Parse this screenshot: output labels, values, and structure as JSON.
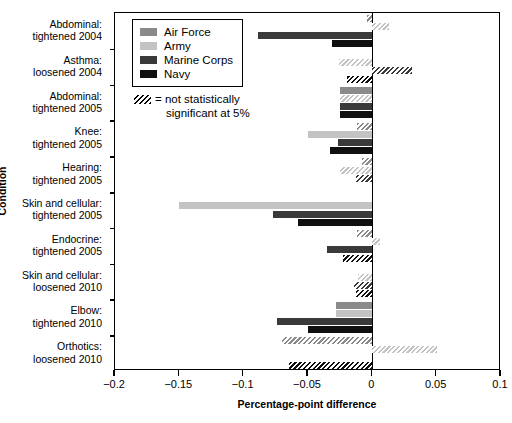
{
  "chart_data": {
    "type": "bar",
    "orientation": "horizontal",
    "title": "",
    "xlabel": "Percentage-point difference",
    "ylabel": "Condition",
    "xlim": [
      -0.2,
      0.1
    ],
    "xticks": [
      -0.2,
      -0.15,
      -0.1,
      -0.05,
      0,
      0.05,
      0.1
    ],
    "xticklabels": [
      "−0.2",
      "−0.15",
      "−0.1",
      "−0.05",
      "0",
      "0.05",
      "0.1"
    ],
    "grid": false,
    "legend_position": "top-left-inside",
    "categories": [
      "Abdominal: tightened 2004",
      "Asthma: loosened 2004",
      "Abdominal: tightened 2005",
      "Knee: tightened 2005",
      "Hearing: tightened 2005",
      "Skin and cellular: tightened 2005",
      "Endocrine: tightened 2005",
      "Skin and cellular: loosened 2010",
      "Elbow: tightened 2010",
      "Orthotics: loosened 2010"
    ],
    "category_lines": [
      [
        "Abdominal:",
        "tightened 2004"
      ],
      [
        "Asthma:",
        "loosened 2004"
      ],
      [
        "Abdominal:",
        "tightened 2005"
      ],
      [
        "Knee:",
        "tightened 2005"
      ],
      [
        "Hearing:",
        "tightened 2005"
      ],
      [
        "Skin and cellular:",
        "tightened 2005"
      ],
      [
        "Endocrine:",
        "tightened 2005"
      ],
      [
        "Skin and cellular:",
        "loosened 2010"
      ],
      [
        "Elbow:",
        "tightened 2010"
      ],
      [
        "Orthotics:",
        "loosened 2010"
      ]
    ],
    "series": [
      {
        "name": "Air Force",
        "key": "af",
        "color": "#8a8a8a",
        "values": [
          -0.004,
          null,
          -0.025,
          -0.012,
          -0.008,
          null,
          -0.012,
          null,
          -0.028,
          -0.07
        ],
        "significant": [
          false,
          null,
          true,
          false,
          false,
          null,
          false,
          null,
          true,
          false
        ]
      },
      {
        "name": "Army",
        "key": "army",
        "color": "#c3c3c3",
        "values": [
          0.013,
          -0.026,
          -0.025,
          -0.05,
          -0.025,
          -0.15,
          0.006,
          -0.011,
          -0.028,
          0.05
        ],
        "significant": [
          false,
          false,
          false,
          true,
          false,
          true,
          false,
          false,
          true,
          false
        ]
      },
      {
        "name": "Marine Corps",
        "key": "usmc",
        "color": "#3a3a3a",
        "values": [
          -0.089,
          0.031,
          -0.025,
          -0.027,
          -0.013,
          -0.077,
          -0.035,
          -0.014,
          -0.074,
          null
        ],
        "significant": [
          true,
          false,
          true,
          true,
          false,
          true,
          true,
          false,
          true,
          null
        ]
      },
      {
        "name": "Navy",
        "key": "navy",
        "color": "#101010",
        "values": [
          -0.031,
          -0.02,
          -0.025,
          -0.033,
          null,
          -0.058,
          -0.023,
          -0.013,
          -0.05,
          -0.065
        ],
        "significant": [
          true,
          false,
          true,
          true,
          null,
          true,
          false,
          false,
          true,
          false
        ]
      }
    ],
    "note": "Hatched bars are not statistically significant at 5%"
  },
  "legend": {
    "items": [
      {
        "label": "Air Force",
        "color": "#8a8a8a"
      },
      {
        "label": "Army",
        "color": "#c3c3c3"
      },
      {
        "label": "Marine Corps",
        "color": "#3a3a3a"
      },
      {
        "label": "Navy",
        "color": "#101010"
      }
    ],
    "note_line1": "= not statistically",
    "note_line2": "significant at 5%"
  },
  "axes": {
    "ylabel": "Condition",
    "xlabel": "Percentage-point difference"
  }
}
